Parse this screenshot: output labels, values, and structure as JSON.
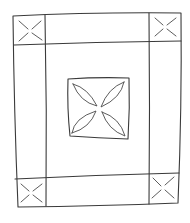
{
  "diagram": {
    "title": "Quilt layout sketch",
    "stroke_color": "#3a3a3a",
    "background": "#ffffff",
    "outer_border": {
      "tl": [
        13,
        16
      ],
      "tr": [
        181,
        13
      ],
      "br": [
        178,
        203
      ],
      "bl": [
        18,
        207
      ]
    },
    "inner_lines": {
      "left_vertical": [
        [
          45,
          15
        ],
        [
          46,
          206
        ]
      ],
      "right_vertical": [
        [
          149,
          13
        ],
        [
          149,
          204
        ]
      ],
      "top_horizontal": [
        [
          14,
          45
        ],
        [
          181,
          41
        ]
      ],
      "bottom_horizontal": [
        [
          15,
          179
        ],
        [
          179,
          173
        ]
      ]
    },
    "corner_blocks": [
      {
        "name": "top-left",
        "motif": "x-cross"
      },
      {
        "name": "top-right",
        "motif": "x-cross"
      },
      {
        "name": "bottom-left",
        "motif": "x-cross"
      },
      {
        "name": "bottom-right",
        "motif": "x-cross"
      }
    ],
    "center_block": {
      "box": [
        68,
        78,
        129,
        138
      ],
      "motif": "four-petal-flower"
    }
  }
}
